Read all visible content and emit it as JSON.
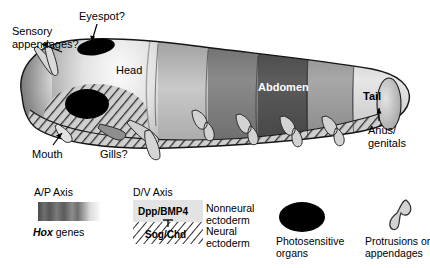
{
  "figure": {
    "type": "biological-schematic",
    "organism_labels": {
      "sensory_appendages": "Sensory\nappendages?",
      "eyespot": "Eyespot?",
      "head": "Head",
      "abdomen": "Abdomen",
      "tail": "Tail",
      "mouth": "Mouth",
      "gills": "Gills?",
      "anus_genitals": "Anus/\ngenitals"
    }
  },
  "legend": {
    "ap_axis": {
      "title": "A/P Axis",
      "caption_italic": "Hox",
      "caption_rest": " genes",
      "gradient_stops": [
        "#4a4a4a",
        "#6b6b6b",
        "#545454",
        "#757575",
        "#5e5e5e",
        "#8c8c8c",
        "#d8d8d8",
        "#f2f2f2"
      ]
    },
    "dv_axis": {
      "title": "D/V Axis",
      "dorsal_label": "Dpp/BMP4",
      "ventral_label": "Sog/Chd",
      "dorsal_tissue": "Nonneural\nectoderm",
      "ventral_tissue": "Neural\nectoderm",
      "dorsal_fill": "#e3e3e3",
      "ventral_fill": "#ffffff"
    },
    "photosensitive": {
      "label": "Photosensitive\norgans",
      "color": "#000000"
    },
    "protrusions": {
      "label": "Protrusions or\nappendages",
      "color": "#d3d3d3"
    }
  },
  "colors": {
    "background": "#ffffff",
    "text": "#000000",
    "text_on_dark": "#ffffff",
    "body_light": "#e8e8e8",
    "body_mid": "#9a9a9a",
    "body_dark": "#5a5a5a",
    "body_darkest": "#2e2e2e",
    "hatch_stroke": "#3a3a3a",
    "appendage": "#d0d0d0",
    "outline": "#1a1a1a"
  }
}
